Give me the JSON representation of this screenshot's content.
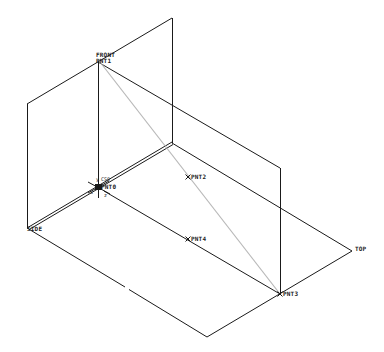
{
  "viewport": {
    "background": "#ffffff",
    "line_color": "#1a1a1a",
    "axis_line_color": "#b8b8b8"
  },
  "datum_planes": {
    "front": {
      "label": "FRONT"
    },
    "top": {
      "label": "TOP"
    },
    "side": {
      "label": "SIDE"
    }
  },
  "coordinate_system": {
    "label": "CS0",
    "axis_labels": {
      "x": "x",
      "y": "y",
      "z": "z"
    }
  },
  "datum_points": [
    {
      "id": "pnt0",
      "label": "PNT0"
    },
    {
      "id": "pnt1",
      "label": "PNT1"
    },
    {
      "id": "pnt2",
      "label": "PNT2"
    },
    {
      "id": "pnt3",
      "label": "PNT3"
    },
    {
      "id": "pnt4",
      "label": "PNT4"
    }
  ]
}
